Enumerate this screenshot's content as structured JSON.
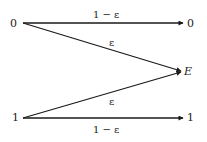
{
  "diagram": {
    "type": "binary erasure channel",
    "inputs": [
      {
        "id": "in0",
        "label": "0"
      },
      {
        "id": "in1",
        "label": "1"
      }
    ],
    "outputs": [
      {
        "id": "out0",
        "label": "0"
      },
      {
        "id": "outE",
        "label": "E"
      },
      {
        "id": "out1",
        "label": "1"
      }
    ],
    "edges": [
      {
        "from": "in0",
        "to": "out0",
        "label": "1 − ε"
      },
      {
        "from": "in0",
        "to": "outE",
        "label": "ε"
      },
      {
        "from": "in1",
        "to": "outE",
        "label": "ε"
      },
      {
        "from": "in1",
        "to": "out1",
        "label": "1 − ε"
      }
    ]
  },
  "colors": {
    "stroke": "#1a1a1a",
    "background": "#ffffff"
  }
}
